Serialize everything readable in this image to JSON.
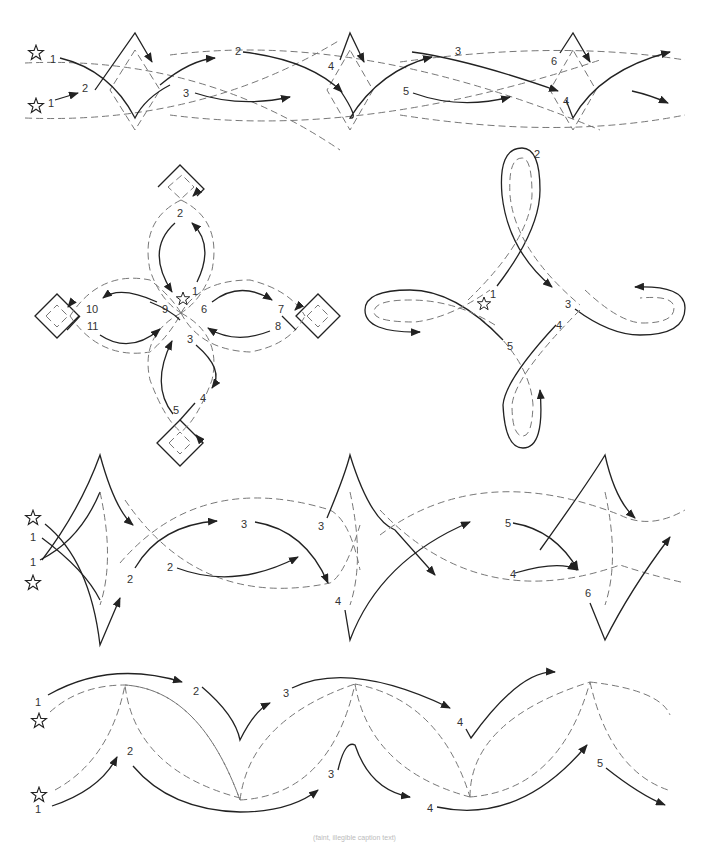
{
  "figure": {
    "type": "quilting stitch-path diagrams",
    "legend_symbols": {
      "start": "star-icon",
      "solid_line": "stitching path",
      "dashed_line": "seam / design guide",
      "arrow": "stitching direction"
    },
    "caption": "(faint, illegible caption text)"
  },
  "panels": [
    {
      "name": "border-1-diamonds",
      "start_labels": [
        "1",
        "1"
      ],
      "step_labels": [
        "1",
        "2",
        "1",
        "2",
        "3",
        "4",
        "5",
        "3",
        "6",
        "4"
      ]
    },
    {
      "name": "cross-motif-squares",
      "step_labels": [
        "1",
        "2",
        "3",
        "4",
        "5",
        "6",
        "7",
        "8",
        "9",
        "10",
        "11"
      ]
    },
    {
      "name": "four-loop-motif",
      "step_labels": [
        "1",
        "2",
        "3",
        "4",
        "5"
      ]
    },
    {
      "name": "border-2-points",
      "step_labels": [
        "1",
        "1",
        "2",
        "2",
        "3",
        "3",
        "2",
        "4",
        "5",
        "4",
        "6"
      ]
    },
    {
      "name": "border-3-arcs",
      "step_labels": [
        "1",
        "2",
        "3",
        "4",
        "1",
        "2",
        "3",
        "4",
        "5"
      ]
    }
  ]
}
